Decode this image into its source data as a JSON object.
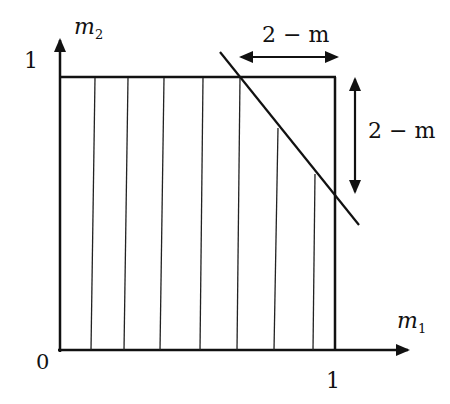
{
  "axes": {
    "x_label": "m",
    "x_sub": "1",
    "y_label": "m",
    "y_sub": "2",
    "origin": "0",
    "x_tick": "1",
    "y_tick": "1"
  },
  "annotations": {
    "horizontal_width": "2 − m",
    "vertical_height": "2 − m"
  },
  "geometry": {
    "origin_px": [
      60,
      350
    ],
    "unit_x_px": 335,
    "unit_y_px": 77,
    "hatch_x_px": [
      91,
      124,
      160,
      200,
      237,
      272,
      313
    ],
    "diagonal_line_px": [
      [
        221,
        52
      ],
      [
        359,
        225
      ]
    ]
  },
  "colors": {
    "ink": "#111111",
    "background": "#ffffff"
  }
}
